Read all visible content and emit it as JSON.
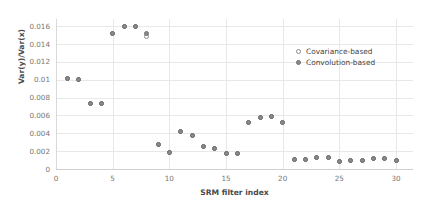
{
  "chart_data": {
    "type": "scatter",
    "title": "",
    "xlabel": "SRM filter index",
    "ylabel": "Var(y)/Var(x)",
    "xlim": [
      0,
      31.5
    ],
    "ylim": [
      0,
      0.0168
    ],
    "xticks": [
      0,
      5,
      10,
      15,
      20,
      25,
      30
    ],
    "xtick_labels": [
      "0",
      "5",
      "10",
      "15",
      "20",
      "25",
      "30"
    ],
    "yticks": [
      0,
      0.002,
      0.004,
      0.006,
      0.008,
      0.01,
      0.012,
      0.014,
      0.016
    ],
    "ytick_labels": [
      "0",
      "0.002",
      "0.004",
      "0.006",
      "0.008",
      "0.01",
      "0.012",
      "0.014",
      "0.016"
    ],
    "grid": true,
    "legend_position": "upper right",
    "x": [
      1,
      2,
      3,
      4,
      5,
      6,
      7,
      8,
      9,
      10,
      11,
      12,
      13,
      14,
      15,
      16,
      17,
      18,
      19,
      20,
      21,
      22,
      23,
      24,
      25,
      26,
      27,
      28,
      29,
      30
    ],
    "series": [
      {
        "name": "Covariance-based",
        "marker": "open-circle",
        "color": "#8a8a8a",
        "values": [
          0.0101,
          0.01,
          0.0073,
          0.0073,
          0.0152,
          0.016,
          0.016,
          0.0148,
          0.0027,
          0.0018,
          0.0042,
          0.0038,
          0.0025,
          0.0023,
          0.0017,
          0.0017,
          0.0052,
          0.0058,
          0.0059,
          0.0052,
          0.0011,
          0.0011,
          0.0013,
          0.0013,
          0.0008,
          0.001,
          0.001,
          0.0012,
          0.0012,
          0.001
        ]
      },
      {
        "name": "Convolution-based",
        "marker": "filled-circle",
        "color": "#8a8a8a",
        "values": [
          0.0101,
          0.01,
          0.0073,
          0.0073,
          0.0152,
          0.016,
          0.016,
          0.0152,
          0.0027,
          0.0018,
          0.0042,
          0.0038,
          0.0025,
          0.0023,
          0.0017,
          0.0017,
          0.0052,
          0.0058,
          0.0059,
          0.0052,
          0.0011,
          0.0011,
          0.0013,
          0.0013,
          0.0008,
          0.001,
          0.001,
          0.0012,
          0.0012,
          0.001
        ]
      }
    ]
  },
  "legend": {
    "items": [
      {
        "label": "Covariance-based",
        "marker": "open-circle"
      },
      {
        "label": "Convolution-based",
        "marker": "filled-circle"
      }
    ]
  }
}
